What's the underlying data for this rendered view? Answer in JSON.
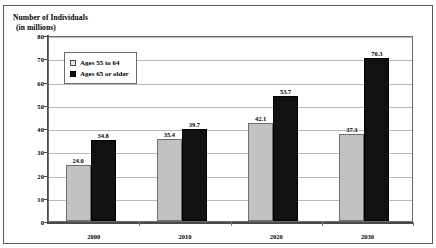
{
  "figure": {
    "title_remnant": "",
    "axis_title_line1": "Number of Individuals",
    "axis_title_line2": "(in millions)"
  },
  "legend": {
    "items": [
      {
        "label": "Ages 55 to 64",
        "swatch": "light-gray-square",
        "color": "#c2c2c2"
      },
      {
        "label": "Ages 65 or older",
        "swatch": "black-square",
        "color": "#111111"
      }
    ]
  },
  "chart_data": {
    "type": "bar",
    "title": "",
    "xlabel": "",
    "ylabel": "Number of Individuals (in millions)",
    "categories": [
      "2000",
      "2010",
      "2020",
      "2030"
    ],
    "series": [
      {
        "name": "Ages 55 to 64",
        "color": "#c2c2c2",
        "values": [
          24.0,
          35.4,
          42.1,
          37.3
        ]
      },
      {
        "name": "Ages 65 or older",
        "color": "#111111",
        "values": [
          34.8,
          39.7,
          53.7,
          70.3
        ]
      }
    ],
    "value_labels": [
      [
        "24.0",
        "34.8"
      ],
      [
        "35.4",
        "39.7"
      ],
      [
        "42.1",
        "53.7"
      ],
      [
        "37.3",
        "70.3"
      ]
    ],
    "ylim": [
      0,
      80
    ],
    "yticks": [
      0,
      10,
      20,
      30,
      40,
      50,
      60,
      70,
      80
    ],
    "ytick_labels": [
      "0",
      "10",
      "20",
      "30",
      "40",
      "50",
      "60",
      "70",
      "80"
    ],
    "grid": true,
    "legend_position": "upper-left-inside"
  }
}
